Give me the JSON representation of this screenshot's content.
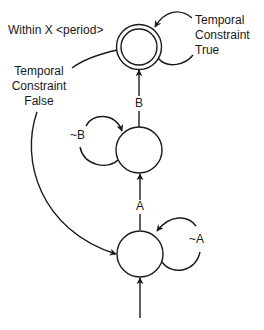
{
  "diagram": {
    "type": "state-machine",
    "colors": {
      "stroke": "#1a1a1a",
      "background": "#ffffff"
    },
    "states": [
      {
        "id": "start",
        "label": "",
        "accepting": false
      },
      {
        "id": "after-a",
        "label": "",
        "accepting": false
      },
      {
        "id": "final",
        "label": "",
        "accepting": true
      }
    ],
    "transitions": [
      {
        "from": "entry",
        "to": "start",
        "label": ""
      },
      {
        "from": "start",
        "to": "start",
        "label": "~A"
      },
      {
        "from": "start",
        "to": "after-a",
        "label": "A"
      },
      {
        "from": "after-a",
        "to": "after-a",
        "label": "~B"
      },
      {
        "from": "after-a",
        "to": "final",
        "label": "B"
      },
      {
        "from": "final",
        "to": "final",
        "label": "Temporal Constraint True"
      },
      {
        "from": "final",
        "to": "start",
        "label": "Temporal Constraint False"
      }
    ],
    "labels": {
      "within": "Within X <period>",
      "tc_true": [
        "Temporal",
        "Constraint",
        "True"
      ],
      "tc_false": [
        "Temporal",
        "Constraint",
        "False"
      ],
      "edge_b": "B",
      "edge_a": "A",
      "loop_not_b": "~B",
      "loop_not_a": "~A"
    }
  }
}
